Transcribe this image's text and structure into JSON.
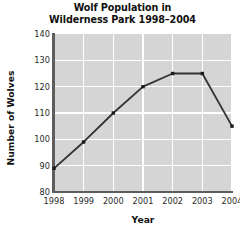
{
  "chart_data": {
    "type": "line",
    "title": "Wolf Population in Wilderness Park 1998–2004",
    "title_lines": [
      "Wolf Population in",
      "Wilderness Park 1998–2004"
    ],
    "xlabel": "Year",
    "ylabel": "Number of Wolves",
    "categories": [
      "1998",
      "1999",
      "2000",
      "2001",
      "2002",
      "2003",
      "2004"
    ],
    "x": [
      1998,
      1999,
      2000,
      2001,
      2002,
      2003,
      2004
    ],
    "values": [
      89,
      99,
      110,
      120,
      125,
      125,
      105
    ],
    "series": [
      {
        "name": "Number of Wolves",
        "values": [
          89,
          99,
          110,
          120,
          125,
          125,
          105
        ]
      }
    ],
    "ylim": [
      80,
      140
    ],
    "yticks": [
      80,
      90,
      100,
      110,
      120,
      130,
      140
    ],
    "ytick_labels": [
      "80",
      "90",
      "100",
      "110",
      "120",
      "130",
      "140"
    ],
    "xlim": [
      1998,
      2004
    ],
    "grid": true,
    "grid_color": "#ffffff",
    "legend": null,
    "legend_position": "none",
    "plot_background": "#d5d5d5",
    "line_color": "#333333",
    "marker": "square",
    "marker_color": "#1a1a1a",
    "axis_color": "#5e5e5e",
    "text_color": "#111111"
  }
}
